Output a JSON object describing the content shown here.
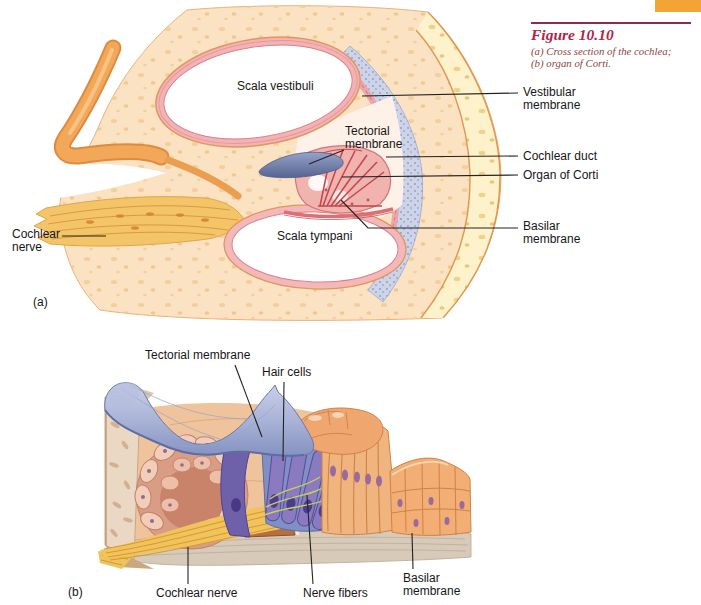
{
  "figure": {
    "title": "Figure 10.10",
    "caption_line1": "(a) Cross section of the cochlea;",
    "caption_line2": "(b) organ of Corti."
  },
  "panel_a": {
    "letter": "(a)",
    "labels": {
      "scala_vestibuli": "Scala vestibuli",
      "tectorial_membrane": "Tectorial membrane",
      "scala_tympani": "Scala tympani",
      "cochlear_nerve": "Cochlear nerve",
      "vestibular_membrane": "Vestibular membrane",
      "cochlear_duct": "Cochlear duct",
      "organ_of_corti": "Organ of Corti",
      "basilar_membrane": "Basilar membrane"
    }
  },
  "panel_b": {
    "letter": "(b)",
    "labels": {
      "tectorial_membrane": "Tectorial membrane",
      "hair_cells": "Hair cells",
      "cochlear_nerve": "Cochlear nerve",
      "nerve_fibers": "Nerve fibers",
      "basilar_membrane": "Basilar membrane"
    }
  },
  "palette": {
    "accent_red": "#b32347",
    "caption_red": "#8d453f",
    "tab_orange": "#f2a434",
    "label_text": "#161616",
    "bone_peach": "#fbe2c3",
    "bone_speckle": "#f3cf9b",
    "pale_yellow_bone": "#fdf2cb",
    "membrane_pink": "#f2b3b5",
    "stippled_blue": "#ccd3e6",
    "tectorial_blue": "#8a97c4",
    "nerve_yellow": "#f2c35c",
    "supporting_cell_orange": "#f0b57e",
    "hair_cell_purple": "#8a7bc0"
  }
}
